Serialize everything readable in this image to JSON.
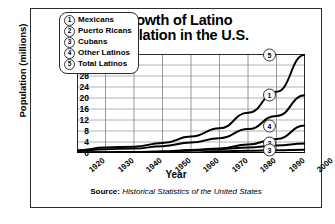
{
  "title": "Growth of Latino Population in the U.S.",
  "title_line1": "Growth of Latino",
  "title_line2": "Population in the U.S.",
  "source": {
    "label": "Source:",
    "title": "Historical Statistics of the United States"
  },
  "legend": [
    {
      "marker": "1",
      "label": "Mexicans"
    },
    {
      "marker": "2",
      "label": "Puerto Ricans"
    },
    {
      "marker": "3",
      "label": "Cubans"
    },
    {
      "marker": "4",
      "label": "Other Latinos"
    },
    {
      "marker": "5",
      "label": "Total Latinos"
    }
  ],
  "end_labels": {
    "s1": "1",
    "s2": "2",
    "s3": "3",
    "s4": "4",
    "s5": "5"
  },
  "chart_data": {
    "type": "line",
    "title": "Growth of Latino Population in the U.S.",
    "xlabel": "Year",
    "ylabel": "Population (millions)",
    "x": [
      1920,
      1930,
      1940,
      1950,
      1960,
      1970,
      1980,
      1990,
      2000
    ],
    "categories": [
      "1920",
      "1930",
      "1940",
      "1950",
      "1960",
      "1970",
      "1980",
      "1990",
      "2000"
    ],
    "xlim": [
      1920,
      2000
    ],
    "ylim": [
      0,
      36
    ],
    "yticks": [
      0,
      4,
      8,
      12,
      16,
      20,
      24,
      28,
      32,
      36
    ],
    "grid": true,
    "legend_position": "upper-left-inset",
    "series": [
      {
        "name": "Mexicans",
        "marker": "1",
        "values": [
          0.7,
          1.4,
          1.6,
          2.5,
          3.8,
          5.4,
          8.7,
          13.5,
          21.0
        ]
      },
      {
        "name": "Puerto Ricans",
        "marker": "2",
        "values": [
          0.1,
          0.2,
          0.2,
          0.4,
          0.9,
          1.4,
          2.0,
          2.7,
          3.5
        ]
      },
      {
        "name": "Cubans",
        "marker": "3",
        "values": [
          0.0,
          0.1,
          0.1,
          0.1,
          0.2,
          0.6,
          0.8,
          1.0,
          1.2
        ]
      },
      {
        "name": "Other Latinos",
        "marker": "4",
        "values": [
          0.2,
          0.3,
          0.4,
          0.6,
          1.1,
          1.6,
          3.1,
          5.1,
          10.0
        ]
      },
      {
        "name": "Total Latinos",
        "marker": "5",
        "values": [
          1.0,
          2.0,
          2.3,
          3.6,
          6.0,
          9.0,
          14.6,
          22.3,
          35.7
        ]
      }
    ]
  }
}
